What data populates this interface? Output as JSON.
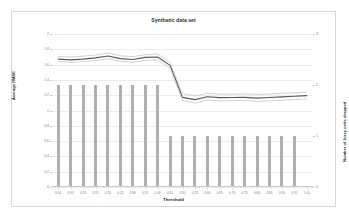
{
  "chart_data": {
    "type": "bar",
    "title": "Synthetic data set",
    "xlabel": "Threshold",
    "ylabel": "Average RMSE",
    "y2label": "Number of fuzzy units dropped",
    "grid": true,
    "legend": "none",
    "categories": [
      "0.00",
      "0.05",
      "0.10",
      "0.15",
      "0.20",
      "0.25",
      "0.30",
      "0.35",
      "0.40",
      "0.45",
      "0.50",
      "0.55",
      "0.60",
      "0.65",
      "0.70",
      "0.75",
      "0.80",
      "0.85",
      "0.90",
      "0.95",
      "1.00"
    ],
    "ylim": [
      0,
      2
    ],
    "yticks": [
      "0",
      "0.2",
      "0.4",
      "0.6",
      "0.8",
      "1",
      "1.2",
      "1.4",
      "1.6",
      "1.8",
      "2"
    ],
    "ylim2": [
      0,
      3
    ],
    "yticks2": [
      "0",
      "1",
      "2",
      "3"
    ],
    "series": [
      {
        "name": "Number of fuzzy units dropped",
        "type": "bar",
        "axis": "y2",
        "color": "#b0b0b0",
        "values": [
          2,
          2,
          2,
          2,
          2,
          2,
          2,
          2,
          2,
          1,
          1,
          1,
          1,
          1,
          1,
          1,
          1,
          1,
          1,
          1,
          0
        ]
      },
      {
        "name": "Average RMSE upper bound",
        "type": "line",
        "axis": "y",
        "color": "#bfbfbf",
        "values": [
          1.705,
          1.7,
          1.71,
          1.725,
          1.75,
          1.715,
          1.705,
          1.73,
          1.738,
          1.628,
          1.22,
          1.19,
          1.225,
          1.215,
          1.212,
          1.218,
          1.21,
          1.216,
          1.224,
          1.232,
          1.238
        ]
      },
      {
        "name": "Average RMSE",
        "type": "line",
        "axis": "y",
        "color": "#595959",
        "values": [
          1.672,
          1.662,
          1.672,
          1.688,
          1.712,
          1.678,
          1.666,
          1.694,
          1.7,
          1.59,
          1.172,
          1.142,
          1.18,
          1.168,
          1.17,
          1.172,
          1.162,
          1.17,
          1.178,
          1.186,
          1.195
        ]
      },
      {
        "name": "Average RMSE lower bound",
        "type": "line",
        "axis": "y",
        "color": "#bfbfbf",
        "values": [
          1.64,
          1.628,
          1.638,
          1.652,
          1.676,
          1.644,
          1.63,
          1.656,
          1.664,
          1.554,
          1.128,
          1.098,
          1.138,
          1.124,
          1.128,
          1.13,
          1.12,
          1.126,
          1.134,
          1.142,
          1.152
        ]
      }
    ]
  }
}
